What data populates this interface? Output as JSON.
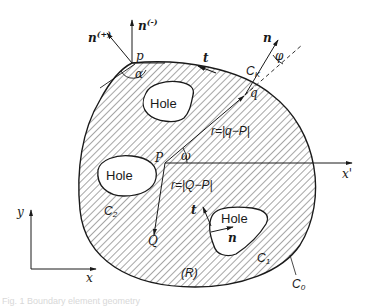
{
  "figure": {
    "type": "boundary-element geometry diagram",
    "region_label": "(R)",
    "holes": [
      {
        "label": "Hole",
        "contour": "C_K"
      },
      {
        "label": "Hole",
        "contour": "C_2"
      },
      {
        "label": "Hole",
        "contour": "C_1"
      }
    ],
    "contours": {
      "outer": {
        "main": "C",
        "sub": "0"
      },
      "c1": {
        "main": "C",
        "sub": "1"
      },
      "c2": {
        "main": "C",
        "sub": "2"
      },
      "ck": {
        "main": "C",
        "sub": "K"
      }
    },
    "points": {
      "p": "p",
      "q": "q",
      "P": "P",
      "Q": "Q"
    },
    "vectors": {
      "n_plus": {
        "main": "n",
        "sup": "(+)"
      },
      "n_minus": {
        "main": "n",
        "sup": "(-)"
      },
      "n_q": "n",
      "t_top": "t",
      "t_hole": "t",
      "n_hole": "n"
    },
    "angles": {
      "alpha": "α",
      "omega": "ω",
      "phi": "φ"
    },
    "distances": {
      "r_q": "r=|q−P|",
      "r_Q": "r=|Q−P|"
    },
    "axes": {
      "x": "x",
      "y": "y",
      "x_prime": "x'"
    },
    "colors": {
      "ink": "#1a1a1a",
      "background": "#ffffff",
      "hatch": "#3a3a3a"
    }
  },
  "caption": {
    "text": "Fig. 1  Boundary element geometry"
  }
}
